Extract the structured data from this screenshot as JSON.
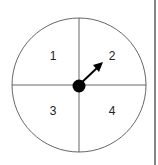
{
  "spinner": {
    "sections": [
      {
        "label": "1",
        "x": 53,
        "y": 56
      },
      {
        "label": "2",
        "x": 111,
        "y": 56
      },
      {
        "label": "3",
        "x": 53,
        "y": 112
      },
      {
        "label": "4",
        "x": 111,
        "y": 112
      }
    ],
    "pointer_target_section": "2"
  },
  "colors": {
    "stroke": "#555555",
    "pointer": "#000000",
    "border": "#333333"
  }
}
